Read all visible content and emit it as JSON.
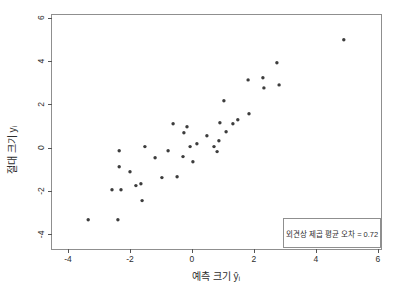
{
  "chart_data": {
    "type": "scatter",
    "title": "",
    "xlabel": "예측 크기 ŷᵢ",
    "ylabel": "절대 크기 yᵢ",
    "xlim": [
      -4.55,
      6.1
    ],
    "ylim": [
      -4.65,
      6.17
    ],
    "x_ticks": [
      -4,
      -2,
      0,
      2,
      4,
      6
    ],
    "y_ticks": [
      -4,
      -2,
      0,
      2,
      4,
      6
    ],
    "grid": false,
    "legend_position": "bottom-right",
    "point_color": "#3d3d3d",
    "frame_color": "#8f8f8f",
    "tick_color": "#555555",
    "text_color": "#2e2e2e",
    "annotation": {
      "text": "외견상 제곱 평균 오차 = 0.72",
      "value": 0.72
    },
    "points": [
      [
        -0.61,
        1.11
      ],
      [
        -0.16,
        0.97
      ],
      [
        4.9,
        4.98
      ],
      [
        2.74,
        3.92
      ],
      [
        1.81,
        3.13
      ],
      [
        2.29,
        3.23
      ],
      [
        2.32,
        2.76
      ],
      [
        2.81,
        2.9
      ],
      [
        1.03,
        2.17
      ],
      [
        1.84,
        1.57
      ],
      [
        0.9,
        1.15
      ],
      [
        1.48,
        1.29
      ],
      [
        1.32,
        1.11
      ],
      [
        1.1,
        0.74
      ],
      [
        0.87,
        0.32
      ],
      [
        0.71,
        0.05
      ],
      [
        0.81,
        -0.18
      ],
      [
        -0.26,
        0.69
      ],
      [
        0.48,
        0.55
      ],
      [
        -2.35,
        -0.14
      ],
      [
        -1.52,
        0.05
      ],
      [
        -0.77,
        -0.14
      ],
      [
        -0.06,
        0.05
      ],
      [
        0.16,
        0.18
      ],
      [
        -1.19,
        -0.46
      ],
      [
        -0.29,
        -0.41
      ],
      [
        0.03,
        -0.65
      ],
      [
        -2.35,
        -0.88
      ],
      [
        -2.0,
        -1.11
      ],
      [
        -0.97,
        -1.38
      ],
      [
        -0.48,
        -1.34
      ],
      [
        -1.81,
        -1.75
      ],
      [
        -1.65,
        -1.66
      ],
      [
        -2.58,
        -1.94
      ],
      [
        -2.29,
        -1.94
      ],
      [
        -1.61,
        -2.44
      ],
      [
        -3.35,
        -3.32
      ],
      [
        -2.39,
        -3.32
      ]
    ]
  }
}
